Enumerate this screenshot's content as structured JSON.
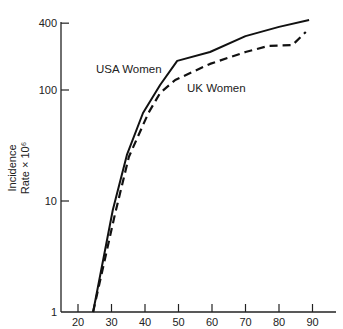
{
  "chart_data": {
    "type": "line",
    "title": "",
    "xlabel": "",
    "ylabel": "Incidence Rate × 10⁶",
    "ylabel_lines": [
      "Incidence",
      "Rate × 10⁶"
    ],
    "yscale": "log",
    "xlim": [
      15,
      97
    ],
    "ylim": [
      1,
      400
    ],
    "x_ticks": [
      20,
      30,
      40,
      50,
      60,
      70,
      80,
      90
    ],
    "y_ticks": [
      1,
      10,
      100,
      400
    ],
    "grid": false,
    "legend": "inline labels",
    "series": [
      {
        "name": "USA Women",
        "style": "solid",
        "color": "#111111",
        "x": [
          24.5,
          30.4,
          34.6,
          39.4,
          44.5,
          49.6,
          59.4,
          70,
          80,
          89
        ],
        "y": [
          1,
          8.3,
          26,
          62,
          111,
          183,
          220,
          306,
          370,
          427
        ]
      },
      {
        "name": "UK Women",
        "style": "dashed",
        "color": "#111111",
        "x": [
          24.5,
          31,
          35.2,
          41,
          44.5,
          49,
          59.4,
          70,
          77,
          84,
          88
        ],
        "y": [
          1,
          7.5,
          25,
          62,
          94,
          123,
          172,
          220,
          250,
          254,
          333
        ]
      }
    ],
    "annotations": [
      {
        "text": "USA Women",
        "x": 41,
        "y": 185
      },
      {
        "text": "UK Women",
        "x": 53,
        "y": 105
      }
    ]
  }
}
